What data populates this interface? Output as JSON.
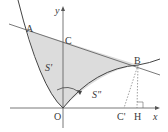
{
  "diagram": {
    "colors": {
      "line": "#4a4a4a",
      "fill": "#d9d9d9",
      "axis": "#555555",
      "dash": "#777777"
    },
    "axes": {
      "x_label": "x",
      "y_label": "y",
      "origin_label": "O"
    },
    "points": {
      "A": {
        "label": "A"
      },
      "B": {
        "label": "B"
      },
      "C": {
        "label": "C"
      },
      "C_prime": {
        "label": "C'"
      },
      "H": {
        "label": "H"
      }
    },
    "regions": {
      "S_prime": {
        "label": "S'"
      },
      "S_double_prime": {
        "label": "S\""
      }
    }
  }
}
